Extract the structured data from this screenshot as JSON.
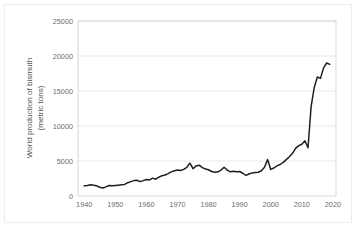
{
  "figure": {
    "background_color": "#ffffff",
    "frame_color": "#ededed",
    "axis_color": "#d2d2d2",
    "grid_color": "#e4e4e4",
    "line_color": "#1f1f1f"
  },
  "axis_titles": {
    "y_line1": "World production of bismuth",
    "y_line2": "(metric tons)"
  },
  "ticks": {
    "y": [
      "0",
      "5000",
      "10000",
      "15000",
      "20000",
      "25000"
    ],
    "x": [
      "1940",
      "1950",
      "1960",
      "1970",
      "1980",
      "1990",
      "2000",
      "2010",
      "2020"
    ]
  },
  "chart_data": {
    "type": "line",
    "title": "",
    "xlabel": "",
    "ylabel": "World production of bismuth (metric tons)",
    "xlim": [
      1938,
      2021
    ],
    "ylim": [
      0,
      25000
    ],
    "yticks": [
      0,
      5000,
      10000,
      15000,
      20000,
      25000
    ],
    "xticks": [
      1940,
      1950,
      1960,
      1970,
      1980,
      1990,
      2000,
      2010,
      2020
    ],
    "grid": "horizontal",
    "legend": "none",
    "series": [
      {
        "name": "World production of bismuth",
        "color": "#1f1f1f",
        "x": [
          1940,
          1941,
          1942,
          1943,
          1944,
          1945,
          1946,
          1947,
          1948,
          1949,
          1950,
          1951,
          1952,
          1953,
          1954,
          1955,
          1956,
          1957,
          1958,
          1959,
          1960,
          1961,
          1962,
          1963,
          1964,
          1965,
          1966,
          1967,
          1968,
          1969,
          1970,
          1971,
          1972,
          1973,
          1974,
          1975,
          1976,
          1977,
          1978,
          1979,
          1980,
          1981,
          1982,
          1983,
          1984,
          1985,
          1986,
          1987,
          1988,
          1989,
          1990,
          1991,
          1992,
          1993,
          1994,
          1995,
          1996,
          1997,
          1998,
          1999,
          2000,
          2001,
          2002,
          2003,
          2004,
          2005,
          2006,
          2007,
          2008,
          2009,
          2010,
          2011,
          2012,
          2013,
          2014,
          2015,
          2016,
          2017,
          2018,
          2019
        ],
        "values": [
          1450,
          1500,
          1600,
          1550,
          1450,
          1250,
          1150,
          1300,
          1500,
          1450,
          1500,
          1550,
          1600,
          1650,
          1900,
          2050,
          2200,
          2250,
          2050,
          2200,
          2350,
          2300,
          2550,
          2400,
          2700,
          2900,
          3000,
          3200,
          3450,
          3600,
          3700,
          3650,
          3800,
          4100,
          4700,
          3900,
          4300,
          4400,
          4050,
          3850,
          3750,
          3500,
          3400,
          3450,
          3700,
          4100,
          3700,
          3450,
          3550,
          3450,
          3500,
          3250,
          2950,
          3150,
          3300,
          3350,
          3400,
          3600,
          4100,
          5200,
          3800,
          4000,
          4300,
          4500,
          4800,
          5200,
          5600,
          6100,
          6800,
          7200,
          7400,
          7900,
          6900,
          12800,
          15500,
          17000,
          16800,
          18300,
          19000,
          18800
        ]
      }
    ]
  }
}
